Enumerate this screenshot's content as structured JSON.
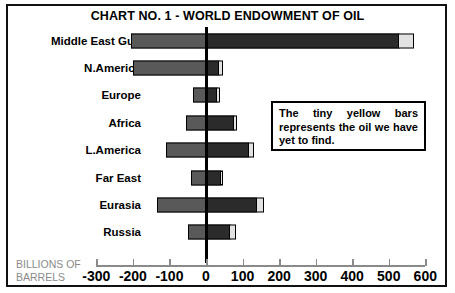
{
  "chart_data": {
    "type": "bar",
    "title": "CHART NO. 1 - WORLD ENDOWMENT OF OIL",
    "orientation": "horizontal",
    "stacked": true,
    "xlabel": "BILLIONS OF BARRELS",
    "ylabel": "",
    "xlim": [
      -300,
      600
    ],
    "xticks": [
      -300,
      -200,
      -100,
      0,
      100,
      200,
      300,
      400,
      500,
      600
    ],
    "xtick_labels": [
      "-300",
      "-200",
      "-100",
      "0",
      "100",
      "200",
      "300",
      "400",
      "500",
      "600"
    ],
    "grid": false,
    "legend": "none",
    "categories": [
      "Middle East Gulf",
      "N.America",
      "Europe",
      "Africa",
      "L.America",
      "Far East",
      "Eurasia",
      "Russia"
    ],
    "series": [
      {
        "name": "Already produced",
        "color": "#595959",
        "values": [
          -205,
          -200,
          -35,
          -55,
          -110,
          -40,
          -135,
          -50
        ]
      },
      {
        "name": "Proven reserves",
        "color": "#2b2b2b",
        "values": [
          530,
          38,
          32,
          78,
          118,
          42,
          140,
          68
        ]
      },
      {
        "name": "Yet to find",
        "color": "#e2e2e2",
        "values": [
          40,
          8,
          6,
          7,
          14,
          5,
          18,
          14
        ]
      }
    ],
    "annotations": [
      {
        "id": "tiny-yellow-bars-note",
        "text": "The tiny yellow bars represents the oil we have yet to find."
      }
    ]
  },
  "axis_title_lines": {
    "line1": "BILLIONS OF",
    "line2": "BARRELS"
  }
}
